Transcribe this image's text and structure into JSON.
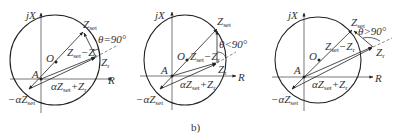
{
  "figure": {
    "caption": "b)",
    "colors": {
      "ink": "#333333",
      "circle": "#222222",
      "axis": "#555555",
      "background": "#ffffff"
    },
    "panels": [
      {
        "id": "panel-1",
        "axis_y_label": "jX",
        "axis_x_label": "R",
        "origin_label": "A",
        "center_label": "O",
        "zset_label": "Z",
        "zset_sub": "set",
        "zr_label": "Z",
        "zr_sub": "r",
        "diff_label": "Z",
        "diff_sub": "set",
        "diff_tail": "−Z",
        "diff_tail_sub": "r",
        "sum_label": "αZ",
        "sum_sub": "set",
        "sum_tail": "+Z",
        "sum_tail_sub": "r",
        "neg_label": "−αZ",
        "neg_sub": "set",
        "theta_label": "θ=90°"
      },
      {
        "id": "panel-2",
        "axis_y_label": "jX",
        "axis_x_label": "R",
        "origin_label": "A",
        "center_label": "O",
        "zset_label": "Z",
        "zset_sub": "set",
        "zr_label": "Z",
        "zr_sub": "r",
        "diff_label": "Z",
        "diff_sub": "set",
        "diff_tail": "−Z",
        "diff_tail_sub": "r",
        "sum_label": "αZ",
        "sum_sub": "set",
        "sum_tail": "+Z",
        "sum_tail_sub": "r",
        "neg_label": "−αZ",
        "neg_sub": "set",
        "theta_label": "θ<90°"
      },
      {
        "id": "panel-3",
        "axis_y_label": "jX",
        "axis_x_label": "R",
        "origin_label": "A",
        "center_label": "O",
        "zset_label": "Z",
        "zset_sub": "set",
        "zr_label": "Z",
        "zr_sub": "r",
        "diff_label": "Z",
        "diff_sub": "set",
        "diff_tail": "−Z",
        "diff_tail_sub": "r",
        "sum_label": "αZ",
        "sum_sub": "set",
        "sum_tail": "+Z",
        "sum_tail_sub": "r",
        "neg_label": "−αZ",
        "neg_sub": "set",
        "theta_label": "θ>90°"
      }
    ]
  }
}
